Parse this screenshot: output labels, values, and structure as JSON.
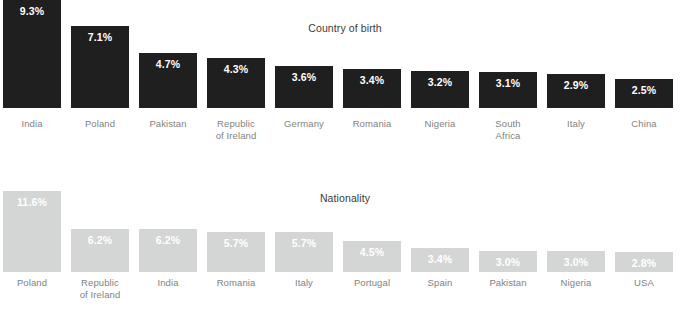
{
  "chart_data": [
    {
      "type": "bar",
      "title": "Country of birth",
      "xlabel": "",
      "ylabel": "",
      "ylim": [
        0,
        9.3
      ],
      "grid": false,
      "legend": "none",
      "bar_color": "#1f1f1f",
      "value_label_color": "#ffffff",
      "categories": [
        "India",
        "Poland",
        "Pakistan",
        "Republic\nof Ireland",
        "Germany",
        "Romania",
        "Nigeria",
        "South\nAfrica",
        "Italy",
        "China"
      ],
      "values": [
        9.3,
        7.1,
        4.7,
        4.3,
        3.6,
        3.4,
        3.2,
        3.1,
        2.9,
        2.5
      ],
      "value_labels": [
        "9.3%",
        "7.1%",
        "4.7%",
        "4.3%",
        "3.6%",
        "3.4%",
        "3.2%",
        "3.1%",
        "2.9%",
        "2.5%"
      ]
    },
    {
      "type": "bar",
      "title": "Nationality",
      "xlabel": "",
      "ylabel": "",
      "ylim": [
        0,
        11.6
      ],
      "grid": false,
      "legend": "none",
      "bar_color": "#d4d6d6",
      "value_label_color": "#ffffff",
      "categories": [
        "Poland",
        "Republic\nof Ireland",
        "India",
        "Romania",
        "Italy",
        "Portugal",
        "Spain",
        "Pakistan",
        "Nigeria",
        "USA"
      ],
      "values": [
        11.6,
        6.2,
        6.2,
        5.7,
        5.7,
        4.5,
        3.4,
        3.0,
        3.0,
        2.8
      ],
      "value_labels": [
        "11.6%",
        "6.2%",
        "6.2%",
        "5.7%",
        "5.7%",
        "4.5%",
        "3.4%",
        "3.0%",
        "3.0%",
        "2.8%"
      ]
    }
  ]
}
